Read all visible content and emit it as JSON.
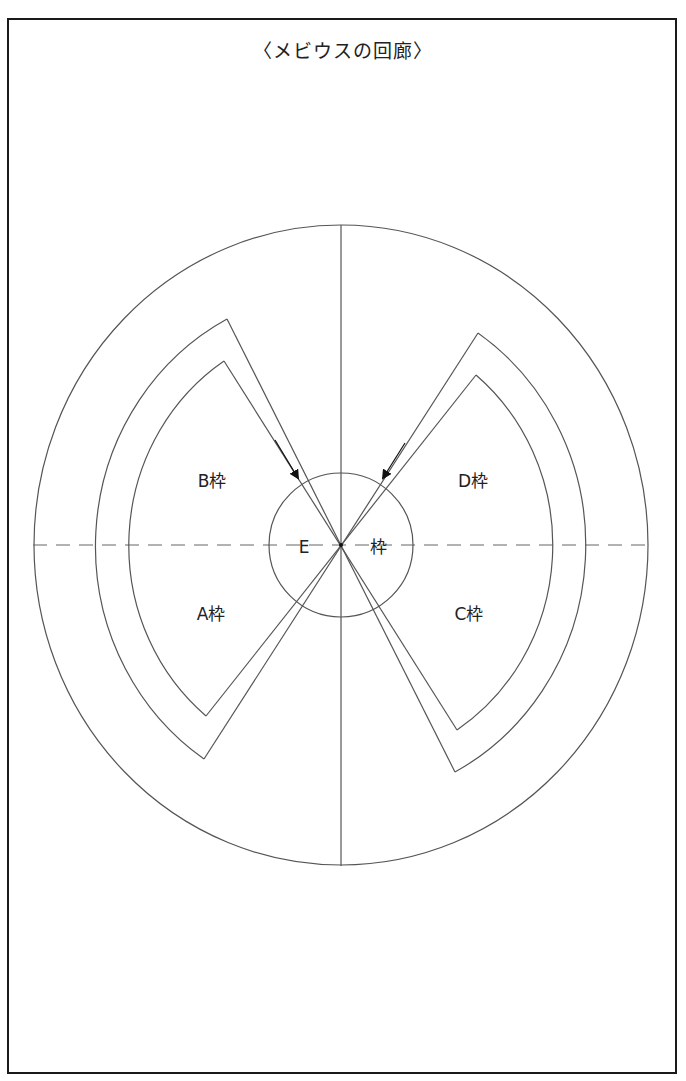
{
  "title": "〈メビウスの回廊〉",
  "colors": {
    "line": "#555555",
    "frame": "#1a1a1a",
    "text": "#222222",
    "background": "#ffffff"
  },
  "diagram": {
    "center": [
      341,
      545
    ],
    "outer_ellipse": {
      "rx": 307,
      "ry": 320
    },
    "middle_ellipse": {
      "rx": 247,
      "ry": 257
    },
    "inner_ellipse": {
      "rx": 212,
      "ry": 221
    },
    "center_circle": {
      "r": 72
    },
    "labels": {
      "B": "B枠",
      "D": "D枠",
      "A": "A枠",
      "C": "C枠",
      "E_left": "E",
      "E_right": "枠"
    }
  }
}
